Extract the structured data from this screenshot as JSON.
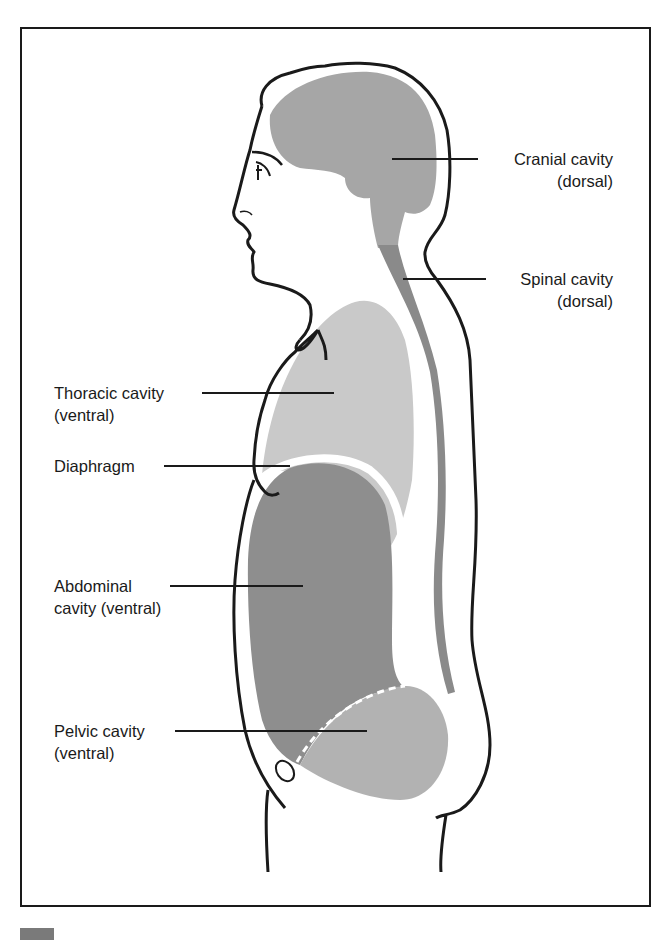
{
  "figure": {
    "colors": {
      "outline": "#1a1a1a",
      "cranial_fill": "#a6a6a6",
      "spinal_fill": "#8a8a8a",
      "thoracic_fill": "#c9c9c9",
      "abdominal_fill": "#8e8e8e",
      "pelvic_fill": "#b2b2b2",
      "gap": "#ffffff"
    },
    "labels": {
      "cranial": {
        "line1": "Cranial cavity",
        "line2": "(dorsal)"
      },
      "spinal": {
        "line1": "Spinal cavity",
        "line2": "(dorsal)"
      },
      "thoracic": {
        "line1": "Thoracic cavity",
        "line2": "(ventral)"
      },
      "diaphragm": {
        "line1": "Diaphragm"
      },
      "abdominal": {
        "line1": "Abdominal",
        "line2": "cavity (ventral)"
      },
      "pelvic": {
        "line1": "Pelvic cavity",
        "line2": "(ventral)"
      }
    }
  }
}
